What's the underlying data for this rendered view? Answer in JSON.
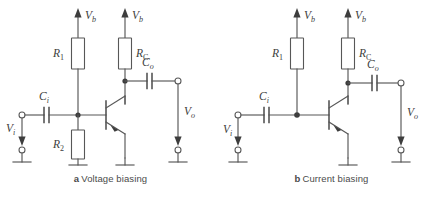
{
  "figure": {
    "background_color": "#ffffff",
    "line_color": "#575757",
    "text_color": "#3d3d3d"
  },
  "panels": [
    {
      "id": "a",
      "caption_letter": "a",
      "caption_text": "Voltage biasing",
      "labels": {
        "supply_left": "V",
        "supply_left_sub": "b",
        "supply_right": "V",
        "supply_right_sub": "b",
        "resistor_bias_top": "R",
        "resistor_bias_top_sub": "1",
        "resistor_collector": "R",
        "resistor_collector_sub": "C",
        "resistor_bias_bottom": "R",
        "resistor_bias_bottom_sub": "2",
        "cap_input": "C",
        "cap_input_sub": "i",
        "cap_output": "C",
        "cap_output_sub": "o",
        "voltage_in": "V",
        "voltage_in_sub": "i",
        "voltage_out": "V",
        "voltage_out_sub": "o"
      },
      "components": [
        "R1-bias-resistor",
        "R2-bias-resistor",
        "RC-collector-resistor",
        "Ci-input-capacitor",
        "Co-output-capacitor",
        "npn-transistor",
        "ground-symbols"
      ]
    },
    {
      "id": "b",
      "caption_letter": "b",
      "caption_text": "Current biasing",
      "labels": {
        "supply_left": "V",
        "supply_left_sub": "b",
        "supply_right": "V",
        "supply_right_sub": "b",
        "resistor_bias_top": "R",
        "resistor_bias_top_sub": "1",
        "resistor_collector": "R",
        "resistor_collector_sub": "C",
        "cap_input": "C",
        "cap_input_sub": "i",
        "cap_output": "C",
        "cap_output_sub": "o",
        "voltage_in": "V",
        "voltage_in_sub": "i",
        "voltage_out": "V",
        "voltage_out_sub": "o"
      },
      "components": [
        "R1-bias-resistor",
        "RC-collector-resistor",
        "Ci-input-capacitor",
        "Co-output-capacitor",
        "npn-transistor",
        "ground-symbols"
      ]
    }
  ]
}
